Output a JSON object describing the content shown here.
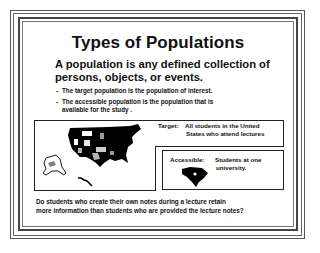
{
  "slide": {
    "title": "Types of Populations",
    "definition": {
      "line1": "A population is any defined collection of",
      "line2": "persons, objects, or events."
    },
    "bullets": [
      {
        "dash": "-",
        "line1": "The target population is the population of interest.",
        "line2": ""
      },
      {
        "dash": "-",
        "line1": "The accessible population is the population that is",
        "line2": "available for the study ."
      }
    ],
    "target": {
      "label": "Target:",
      "line1": "All students in the United",
      "line2": "States who attend lectures"
    },
    "accessible": {
      "label": "Accessible:",
      "line1": "Students at one",
      "line2": "university."
    },
    "question": {
      "line1": "Do students who create their own notes during a lecture retain",
      "line2": "more information than students who are provided the lecture notes?"
    },
    "icons": {
      "usa_map": "usa-map-icon",
      "state_map": "south-carolina-map-icon"
    },
    "colors": {
      "text": "#111111",
      "border": "#444444",
      "background": "#ffffff",
      "map_fill": "#000000"
    }
  }
}
